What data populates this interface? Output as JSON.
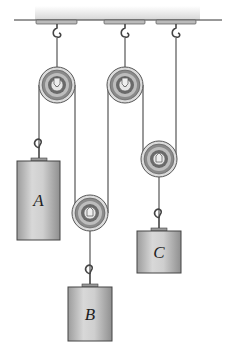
{
  "diagram": {
    "type": "pulley-system",
    "blocks": [
      {
        "label": "A"
      },
      {
        "label": "B"
      },
      {
        "label": "C"
      }
    ],
    "colors": {
      "ceiling": "#cfcfcf",
      "rope": "#555555",
      "pulley_rim": "#9a9a9a",
      "pulley_groove": "#6e6e6e",
      "block_fill": "#bdbdbd",
      "block_edge": "#444444"
    }
  }
}
